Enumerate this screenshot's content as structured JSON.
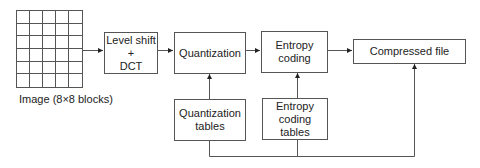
{
  "diagram": {
    "type": "block-diagram",
    "title": "",
    "input": {
      "label": "Image (8×8 blocks)",
      "grid_columns": 5,
      "grid_rows": 6
    },
    "blocks": [
      {
        "id": "level_shift_dct",
        "label": "Level shift\n+\nDCT"
      },
      {
        "id": "quantization",
        "label": "Quantization"
      },
      {
        "id": "entropy_coding",
        "label": "Entropy\ncoding"
      },
      {
        "id": "compressed_file",
        "label": "Compressed file"
      },
      {
        "id": "quantization_tables",
        "label": "Quantization\ntables"
      },
      {
        "id": "entropy_coding_tables",
        "label": "Entropy\ncoding\ntables"
      }
    ],
    "edges": [
      {
        "from": "image",
        "to": "level_shift_dct"
      },
      {
        "from": "level_shift_dct",
        "to": "quantization"
      },
      {
        "from": "quantization",
        "to": "entropy_coding"
      },
      {
        "from": "entropy_coding",
        "to": "compressed_file"
      },
      {
        "from": "quantization_tables",
        "to": "quantization"
      },
      {
        "from": "entropy_coding_tables",
        "to": "entropy_coding"
      },
      {
        "from": "quantization_tables",
        "to": "compressed_file",
        "via": "bottom bus"
      },
      {
        "from": "entropy_coding_tables",
        "to": "compressed_file",
        "via": "bottom bus"
      }
    ],
    "colors": {
      "line": "#555555",
      "text": "#222222",
      "background": "#ffffff"
    }
  }
}
